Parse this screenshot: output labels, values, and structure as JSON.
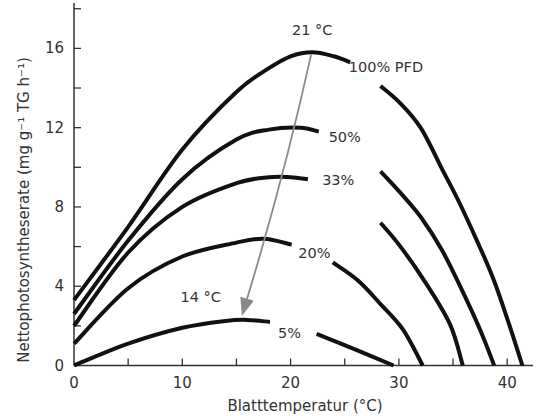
{
  "chart_data": {
    "type": "line",
    "title": "",
    "xlabel": "Blatttemperatur (°C)",
    "ylabel": "Nettophotosyntheserate (mg g⁻¹ TG h⁻¹)",
    "xlim": [
      0,
      42.5
    ],
    "ylim": [
      0,
      18.5
    ],
    "x_ticks": [
      0,
      10,
      20,
      30,
      40
    ],
    "x_minor_ticks": [
      5,
      15,
      25,
      35
    ],
    "y_ticks": [
      0,
      4,
      8,
      12,
      16
    ],
    "y_minor_ticks": [
      2,
      6,
      10,
      14,
      18
    ],
    "x_tick_labels": [
      "0",
      "10",
      "20",
      "30",
      "40"
    ],
    "y_tick_labels": [
      "0",
      "4",
      "8",
      "12",
      "16"
    ],
    "grid": false,
    "legend": "none (inline labels)",
    "series": [
      {
        "name": "100% PFD",
        "label": "100% PFD",
        "points": [
          [
            0,
            3.3
          ],
          [
            5,
            7.0
          ],
          [
            10,
            10.9
          ],
          [
            15,
            13.8
          ],
          [
            18,
            15.0
          ],
          [
            20,
            15.6
          ],
          [
            22,
            15.8
          ],
          [
            24,
            15.6
          ],
          [
            25.5,
            15.3
          ],
          [
            28.3,
            14.1
          ],
          [
            30,
            13.3
          ],
          [
            32,
            12.0
          ],
          [
            34,
            9.9
          ],
          [
            35.6,
            8.2
          ],
          [
            37.2,
            6.3
          ],
          [
            38.7,
            4.4
          ],
          [
            40.1,
            2.2
          ],
          [
            41.4,
            0
          ]
        ],
        "gap": [
          25.5,
          28.3
        ]
      },
      {
        "name": "50%",
        "label": "50%",
        "points": [
          [
            0,
            2.6
          ],
          [
            5,
            6.3
          ],
          [
            10,
            9.4
          ],
          [
            15,
            11.4
          ],
          [
            18,
            11.9
          ],
          [
            20.9,
            12.0
          ],
          [
            22.6,
            11.8
          ],
          [
            28.3,
            9.8
          ],
          [
            30,
            8.8
          ],
          [
            32,
            7.5
          ],
          [
            34,
            5.8
          ],
          [
            36,
            3.6
          ],
          [
            37.5,
            1.8
          ],
          [
            38.8,
            0
          ]
        ],
        "gap": [
          22.6,
          28.3
        ]
      },
      {
        "name": "33%",
        "label": "33%",
        "points": [
          [
            0,
            2.0
          ],
          [
            5,
            5.7
          ],
          [
            10,
            8.0
          ],
          [
            15,
            9.2
          ],
          [
            18,
            9.5
          ],
          [
            20,
            9.5
          ],
          [
            21.6,
            9.4
          ],
          [
            28.3,
            7.2
          ],
          [
            30,
            6.1
          ],
          [
            32.2,
            4.4
          ],
          [
            34.7,
            2.1
          ],
          [
            35.9,
            0
          ]
        ],
        "gap": [
          21.6,
          28.3
        ]
      },
      {
        "name": "20%",
        "label": "20%",
        "points": [
          [
            0,
            1.1
          ],
          [
            5,
            3.9
          ],
          [
            10,
            5.5
          ],
          [
            15,
            6.2
          ],
          [
            17.5,
            6.4
          ],
          [
            20.1,
            6.1
          ],
          [
            23.9,
            5.2
          ],
          [
            26.2,
            4.3
          ],
          [
            28.3,
            3.1
          ],
          [
            30.4,
            1.8
          ],
          [
            32.2,
            0
          ]
        ],
        "gap": [
          20.1,
          23.9
        ]
      },
      {
        "name": "5%",
        "label": "5%",
        "points": [
          [
            0,
            0
          ],
          [
            5,
            1.1
          ],
          [
            10,
            1.9
          ],
          [
            14,
            2.25
          ],
          [
            16,
            2.3
          ],
          [
            18.1,
            2.2
          ],
          [
            22.4,
            1.6
          ],
          [
            26,
            0.8
          ],
          [
            29.5,
            0
          ]
        ],
        "gap": [
          18.1,
          22.4
        ]
      }
    ],
    "annotations": [
      {
        "text": "21 °C",
        "x": 22,
        "y": 16.7,
        "role": "optimum-label-top"
      },
      {
        "text": "14 °C",
        "x": 11.7,
        "y": 3.2,
        "role": "optimum-label-bottom"
      },
      {
        "text": "100% PFD",
        "x": 28.8,
        "y": 14.8
      },
      {
        "text": "50%",
        "x": 25.0,
        "y": 11.3
      },
      {
        "text": "33%",
        "x": 24.4,
        "y": 9.1
      },
      {
        "text": "20%",
        "x": 22.2,
        "y": 5.4
      },
      {
        "text": "5%",
        "x": 19.9,
        "y": 1.4
      }
    ],
    "arrow": {
      "from": [
        21.9,
        15.7
      ],
      "to": [
        15.5,
        2.5
      ],
      "color": "#8a8a8a",
      "meaning": "shift of temperature optimum from 21 °C to 14 °C with decreasing light"
    }
  },
  "colors": {
    "curves": "#111111",
    "axes": "#333333",
    "arrow": "#8a8a8a",
    "text": "#333333"
  }
}
